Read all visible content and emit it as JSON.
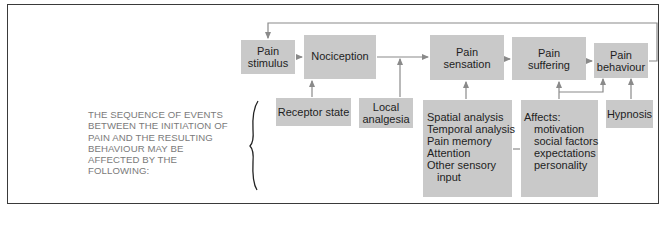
{
  "diagram": {
    "intro_text_lines": [
      "THE SEQUENCE OF EVENTS",
      "BETWEEN THE INITIATION OF",
      "PAIN AND THE RESULTING",
      "BEHAVIOUR MAY BE",
      "AFFECTED BY THE",
      "FOLLOWING:"
    ],
    "main_chain": [
      {
        "id": "pain-stimulus",
        "lines": [
          "Pain",
          "stimulus"
        ]
      },
      {
        "id": "nociception",
        "lines": [
          "Nociception"
        ]
      },
      {
        "id": "pain-sensation",
        "lines": [
          "Pain",
          "sensation"
        ]
      },
      {
        "id": "pain-suffering",
        "lines": [
          "Pain",
          "suffering"
        ]
      },
      {
        "id": "pain-behaviour",
        "lines": [
          "Pain",
          "behaviour"
        ]
      }
    ],
    "modifiers": {
      "receptor_state": {
        "lines": [
          "Receptor state"
        ],
        "affects": "nociception"
      },
      "local_analgesia": {
        "lines": [
          "Local",
          "analgesia"
        ],
        "affects": "nociception-to-pain-sensation"
      },
      "sensation_factors": {
        "lines": [
          "Spatial analysis",
          "Temporal analysis",
          "Pain memory",
          "Attention",
          "Other sensory",
          "input"
        ],
        "affects": "pain-sensation"
      },
      "affects": {
        "heading": "Affects:",
        "items": [
          "motivation",
          "social factors",
          "expectations",
          "personality"
        ],
        "affects": [
          "pain-suffering",
          "pain-behaviour"
        ]
      },
      "hypnosis": {
        "lines": [
          "Hypnosis"
        ],
        "affects": "pain-behaviour"
      }
    },
    "feedback": {
      "from": "pain-behaviour",
      "to": "pain-stimulus"
    },
    "colors": {
      "box_fill": "#c9c9c9",
      "box_text": "#1e1e1e",
      "connector": "#8a8a8a",
      "intro_text": "#7a7a7a",
      "frame": "#3a3a3a"
    }
  }
}
